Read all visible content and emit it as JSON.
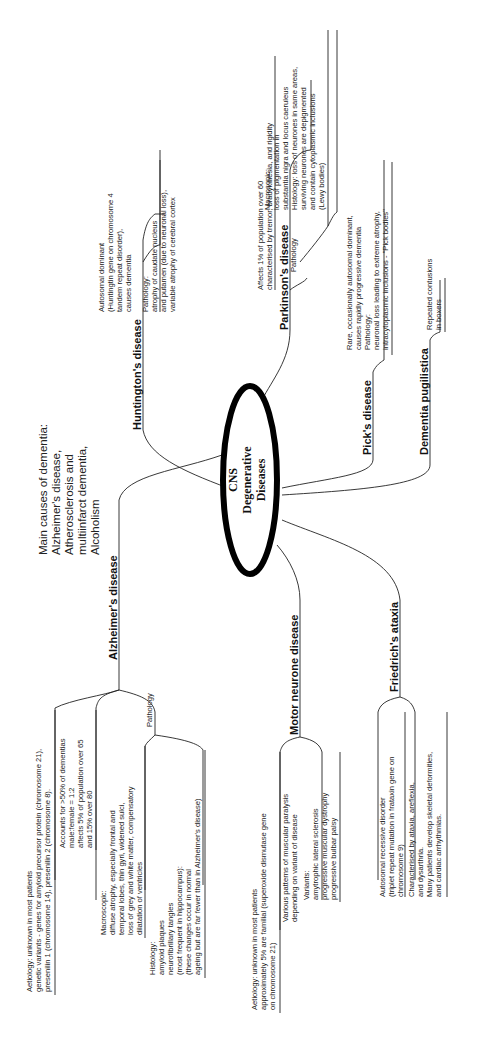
{
  "center": {
    "lines": [
      "CNS",
      "Degenerative",
      "Diseases"
    ]
  },
  "note": {
    "lines": [
      "Main causes of dementia:",
      "Alzheimer's disease,",
      "Atherosclerosis and",
      "multiinfarct dementia,",
      "Alcoholism"
    ]
  },
  "branches": {
    "huntington": {
      "title": "Huntington's disease",
      "desc": [
        "Autosomal dominant",
        "(Huntingtin gene on chromosome 4",
        "tandem repeat disorder),",
        "causes dementia"
      ],
      "pathology": [
        "Pathology:",
        "atrophy of caudate nucleus",
        "and putamen (due to neuronal loss),",
        "variable atrophy of cerebral cortex"
      ]
    },
    "parkinson": {
      "title": "Parkinson's disease",
      "desc": [
        "Affects 1% of population over 60",
        "characterised by tremor, bradykinesia, and rigidity"
      ],
      "pathology_label": "Pathology",
      "pathology": [
        "Macrosopic:",
        "loss of pigmentation in",
        "substantia nigra and locus caeruleus",
        "Histology: loss of neurones in same areas,",
        "surviving neurones are depigmented",
        "and contain cytoplasmic inclusions",
        "(Lewy bodies)"
      ]
    },
    "pick": {
      "title": "Pick's disease",
      "desc": [
        "Rare, occasionally autosomal dominant,",
        "causes rapidly progressive dementia",
        "Pathology:",
        "neuronal loss leading to extreme atrophy,",
        "intracytoplasmic inclusions - \"Pick bodies\""
      ]
    },
    "pugilistica": {
      "title": "Dementia pugilistica",
      "desc": [
        "Repeated contusions",
        "in boxers"
      ]
    },
    "alzheimer": {
      "title": "Alzheimer's disease",
      "aetiology": [
        "Aetiology: unknown in most patients",
        "genetic variants - genes for amyloid precursor protein (chromosome 21),",
        "presenilin 1 (chromosome 14), presenilin 2 (chromosome 8)."
      ],
      "epidemiology": [
        "Accounts for >50% of dementias",
        "male:female = 1:2",
        "affects 5% of population over 65",
        "and 15% over 80"
      ],
      "pathology_label": "Pathology",
      "macroscopic": [
        "Macroscopic:",
        "diffuse atrophy, especially frontal and",
        "temporal lobes, thin gyri, widened sulci,",
        "loss of grey and white matter, compensatory",
        "dilatation of ventricles"
      ],
      "histology": [
        "Histology:",
        "amyloid plaques",
        "neurofibrillary tangles",
        "(most frequent in hippocampus):",
        "(these changes occur in normal",
        "ageing but are far fewer than in Alzheimer's disease)"
      ]
    },
    "motor": {
      "title": "Motor neurone disease",
      "aetiology": [
        "Aetiology: unknown in most patients",
        "approximately 5% are familial (superoxide dismutase gene",
        "on chromosome 21)"
      ],
      "patterns": [
        "Various patterns of muscular paralysis",
        "depending on variant of disease"
      ],
      "variants": [
        "Variants:",
        "amytrophic lateral sclerosis",
        "progressive muscular dystrophy",
        "progressive bulbar palsy"
      ]
    },
    "friedrich": {
      "title": "Friedrich's ataxia",
      "genetics": [
        "Autosomal recessive disorder",
        "(triplet repeat mutation in frataxin gene on",
        "chromosome 9)"
      ],
      "features": [
        "Characterised by ataxia, areflexia,",
        "and dysarthria.",
        "Many patients develop skeletal deformities,",
        "and cardiac arrhythmias."
      ]
    }
  }
}
